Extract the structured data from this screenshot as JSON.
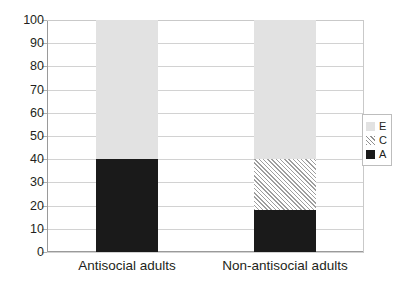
{
  "chart_data": {
    "type": "bar",
    "title": "",
    "xlabel": "",
    "ylabel": "",
    "ylim": [
      0,
      100
    ],
    "yticks": [
      0,
      10,
      20,
      30,
      40,
      50,
      60,
      70,
      80,
      90,
      100
    ],
    "grid": true,
    "stacked": true,
    "legend_position": "right",
    "categories": [
      "Antisocial adults",
      "Non-antisocial adults"
    ],
    "series": [
      {
        "name": "A",
        "label": "A",
        "color": "#1a1a1a",
        "fill": "solid",
        "values": [
          40,
          18
        ]
      },
      {
        "name": "C",
        "label": "C",
        "color": "#9e9e9e",
        "fill": "hatch",
        "values": [
          0,
          22
        ]
      },
      {
        "name": "E",
        "label": "E",
        "color": "#e2e2e2",
        "fill": "solid",
        "values": [
          60,
          60
        ]
      }
    ]
  },
  "axis": {
    "y_tick_labels": [
      "100",
      "90",
      "80",
      "70",
      "60",
      "50",
      "40",
      "30",
      "20",
      "10",
      "0"
    ]
  },
  "categories": [
    {
      "label": "Antisocial adults"
    },
    {
      "label": "Non-antisocial adults"
    }
  ],
  "legend": {
    "items": [
      {
        "label": "E",
        "swatch": "light-gray-square"
      },
      {
        "label": "C",
        "swatch": "hatched-square"
      },
      {
        "label": "A",
        "swatch": "black-square"
      }
    ]
  }
}
